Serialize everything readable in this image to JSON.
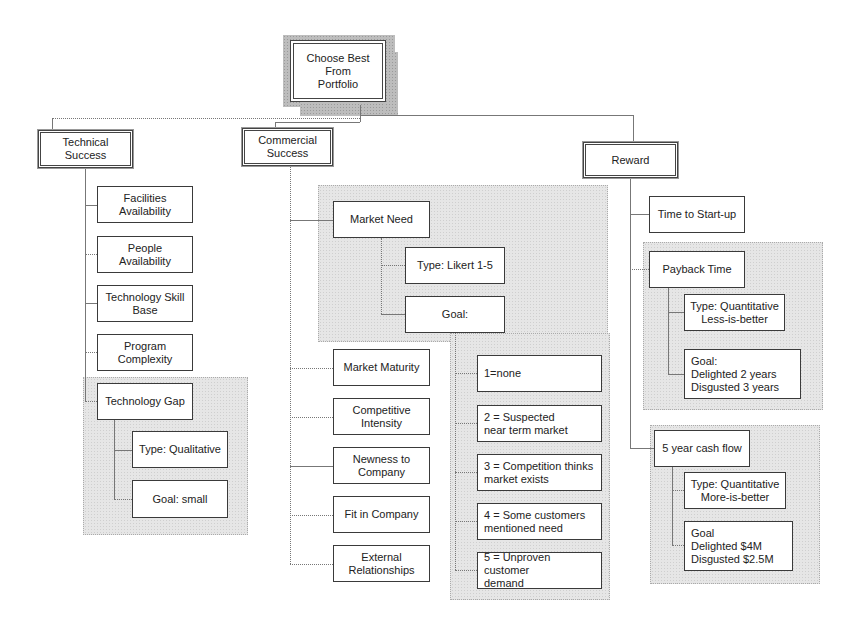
{
  "diagram": {
    "type": "hierarchy-tree",
    "root": {
      "label": "Choose Best From\nPortfolio"
    },
    "branches": {
      "technical": {
        "label": "Technical\nSuccess",
        "children": [
          {
            "label": "Facilities\nAvailability"
          },
          {
            "label": "People\nAvailability"
          },
          {
            "label": "Technology Skill\nBase"
          },
          {
            "label": "Program\nComplexity"
          },
          {
            "label": "Technology Gap",
            "type": "Type:  Qualitative",
            "goal": "Goal:  small"
          }
        ]
      },
      "commercial": {
        "label": "Commercial\nSuccess",
        "market_need": {
          "label": "Market Need",
          "type": "Type: Likert 1-5",
          "goal": "Goal:",
          "scale": [
            "1=none",
            "2 = Suspected\n     near term market",
            "3 = Competition thinks\n    market exists",
            "4 =  Some customers\n       mentioned need",
            "5 = Unproven customer\n     demand"
          ]
        },
        "children": [
          {
            "label": "Market Maturity"
          },
          {
            "label": "Competitive\nIntensity"
          },
          {
            "label": "Newness to\nCompany"
          },
          {
            "label": "Fit in Company"
          },
          {
            "label": "External\nRelationships"
          }
        ]
      },
      "reward": {
        "label": "Reward",
        "time_to_startup": {
          "label": "Time to Start-up"
        },
        "payback": {
          "label": "Payback Time",
          "type": "Type: Quantitative\nLess-is-better",
          "goal": "Goal:\n      Delighted 2 years\n      Disgusted 3 years"
        },
        "cashflow": {
          "label": "5 year cash flow",
          "type": "Type: Quantitative\nMore-is-better",
          "goal": "Goal\n      Delighted $4M\n      Disgusted $2.5M"
        }
      }
    }
  }
}
